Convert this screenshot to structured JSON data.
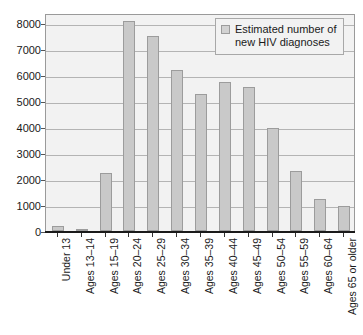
{
  "chart_data": {
    "type": "bar",
    "title": "",
    "xlabel": "",
    "ylabel": "",
    "ylim": [
      0,
      8400
    ],
    "yticks": [
      0,
      1000,
      2000,
      3000,
      4000,
      5000,
      6000,
      7000,
      8000
    ],
    "ytick_labels": [
      "0",
      "1000",
      "2000",
      "3000",
      "4000",
      "5000",
      "6000",
      "7000",
      "8000"
    ],
    "grid": true,
    "legend_position": "top-right",
    "legend": [
      "Estimated number of new HIV diagnoses"
    ],
    "series_name": "Estimated number of new HIV diagnoses",
    "bar_color": "#c9c9c9",
    "bar_edge_color": "#9c9c9c",
    "plot_background": "#f2f2f2",
    "gridline_color": "#b4b4b4",
    "categories": [
      "Under 13",
      "Ages 13–14",
      "Ages 15–19",
      "Ages 20–24",
      "Ages 25–29",
      "Ages 30–34",
      "Ages 35–39",
      "Ages 40–44",
      "Ages 45–49",
      "Ages 50–54",
      "Ages 55–59",
      "Ages 60–64",
      "Ages 65 or older"
    ],
    "values": [
      200,
      50,
      2230,
      8080,
      7500,
      6210,
      5280,
      5760,
      5560,
      3980,
      2300,
      1220,
      950
    ]
  },
  "legend": {
    "line1": "Estimated number of",
    "line2": "new HIV diagnoses"
  }
}
